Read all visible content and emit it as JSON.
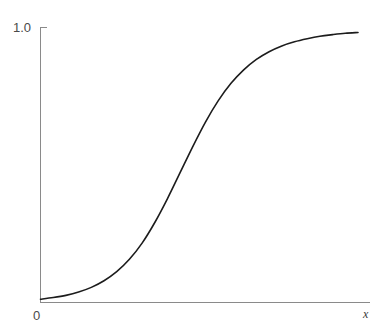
{
  "figure": {
    "background_color": "#ffffff",
    "width": 386,
    "height": 326
  },
  "axes": {
    "x_axis_label": "x",
    "y_axis_label": "",
    "origin_label": "0",
    "y_top_tick_label": "1.0",
    "axis_color": "#8a8a8a",
    "curve_color": "#1c1c1c"
  },
  "chart_data": {
    "type": "line",
    "title": "",
    "subtitle": "",
    "xlabel": "x",
    "ylabel": "",
    "grid": false,
    "legend": null,
    "xlim": [
      0,
      10
    ],
    "ylim": [
      0,
      1.0
    ],
    "x_tick_labels": [
      "0"
    ],
    "y_tick_labels": [
      "1.0"
    ],
    "series": [
      {
        "name": "logistic sigmoid",
        "x": [
          0.0,
          0.4,
          0.8,
          1.2,
          1.6,
          2.0,
          2.4,
          2.8,
          3.2,
          3.6,
          4.0,
          4.4,
          4.8,
          5.2,
          5.6,
          6.0,
          6.4,
          6.8,
          7.2,
          7.6,
          8.0,
          8.4,
          8.8,
          9.2,
          9.6,
          10.0
        ],
        "y": [
          0.012,
          0.018,
          0.026,
          0.038,
          0.055,
          0.079,
          0.112,
          0.157,
          0.216,
          0.291,
          0.378,
          0.473,
          0.568,
          0.657,
          0.734,
          0.797,
          0.846,
          0.884,
          0.912,
          0.933,
          0.948,
          0.959,
          0.968,
          0.974,
          0.979,
          0.982
        ]
      }
    ],
    "annotations": []
  }
}
